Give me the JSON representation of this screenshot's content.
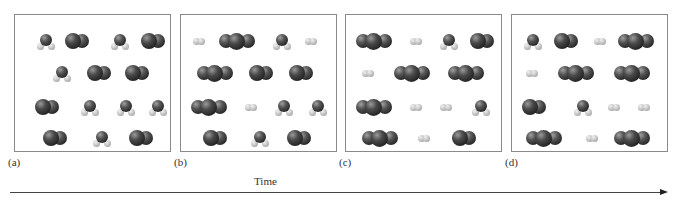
{
  "figure": {
    "axis_label": "Time",
    "legend": {
      "H2O": "bent triatomic: dark O with two light H",
      "CO": "diatomic: two dark atoms",
      "CO2": "linear triatomic: three dark atoms",
      "H2": "diatomic: two light atoms"
    },
    "panels": [
      {
        "label": "(a)",
        "left": 14,
        "rows": [
          [
            {
              "type": "H2O",
              "x": 22
            },
            {
              "type": "CO",
              "x": 50
            },
            {
              "type": "H2O",
              "x": 96
            },
            {
              "type": "CO",
              "x": 126
            }
          ],
          [
            {
              "type": "H2O",
              "x": 38
            },
            {
              "type": "CO",
              "x": 72
            },
            {
              "type": "CO",
              "x": 110
            }
          ],
          [
            {
              "type": "CO",
              "x": 20
            },
            {
              "type": "H2O",
              "x": 66
            },
            {
              "type": "H2O",
              "x": 102
            },
            {
              "type": "H2O",
              "x": 134
            }
          ],
          [
            {
              "type": "CO",
              "x": 28
            },
            {
              "type": "H2O",
              "x": 78
            },
            {
              "type": "CO",
              "x": 114
            }
          ]
        ],
        "counts": {
          "H2O": 7,
          "CO": 7,
          "CO2": 0,
          "H2": 0
        }
      },
      {
        "label": "(b)",
        "left": 180,
        "rows": [
          [
            {
              "type": "H2",
              "x": 12
            },
            {
              "type": "CO2",
              "x": 38
            },
            {
              "type": "H2O",
              "x": 92
            },
            {
              "type": "H2",
              "x": 124
            }
          ],
          [
            {
              "type": "CO2",
              "x": 16
            },
            {
              "type": "CO",
              "x": 68
            },
            {
              "type": "CO",
              "x": 108
            }
          ],
          [
            {
              "type": "CO2",
              "x": 10
            },
            {
              "type": "H2",
              "x": 64
            },
            {
              "type": "H2O",
              "x": 94
            },
            {
              "type": "H2O",
              "x": 128
            }
          ],
          [
            {
              "type": "CO",
              "x": 22
            },
            {
              "type": "H2O",
              "x": 70
            },
            {
              "type": "CO",
              "x": 106
            }
          ]
        ],
        "counts": {
          "H2O": 4,
          "CO": 4,
          "CO2": 3,
          "H2": 3
        }
      },
      {
        "label": "(c)",
        "left": 345,
        "rows": [
          [
            {
              "type": "CO2",
              "x": 10
            },
            {
              "type": "H2",
              "x": 64
            },
            {
              "type": "H2O",
              "x": 94
            },
            {
              "type": "CO",
              "x": 124
            }
          ],
          [
            {
              "type": "H2",
              "x": 16
            },
            {
              "type": "CO2",
              "x": 48
            },
            {
              "type": "CO2",
              "x": 102
            }
          ],
          [
            {
              "type": "CO2",
              "x": 10
            },
            {
              "type": "H2",
              "x": 64
            },
            {
              "type": "H2",
              "x": 94
            },
            {
              "type": "H2O",
              "x": 126
            }
          ],
          [
            {
              "type": "CO2",
              "x": 16
            },
            {
              "type": "H2",
              "x": 72
            },
            {
              "type": "CO",
              "x": 106
            }
          ]
        ],
        "counts": {
          "H2O": 2,
          "CO": 2,
          "CO2": 5,
          "H2": 5
        }
      },
      {
        "label": "(d)",
        "left": 511,
        "rows": [
          [
            {
              "type": "H2O",
              "x": 12
            },
            {
              "type": "CO",
              "x": 42
            },
            {
              "type": "H2",
              "x": 82
            },
            {
              "type": "CO2",
              "x": 106
            }
          ],
          [
            {
              "type": "H2",
              "x": 14
            },
            {
              "type": "CO2",
              "x": 46
            },
            {
              "type": "CO2",
              "x": 102
            }
          ],
          [
            {
              "type": "CO",
              "x": 10
            },
            {
              "type": "H2O",
              "x": 62
            },
            {
              "type": "H2",
              "x": 96
            },
            {
              "type": "H2",
              "x": 126
            }
          ],
          [
            {
              "type": "CO2",
              "x": 14
            },
            {
              "type": "H2",
              "x": 74
            },
            {
              "type": "CO2",
              "x": 102
            }
          ]
        ],
        "counts": {
          "H2O": 2,
          "CO": 2,
          "CO2": 5,
          "H2": 5
        }
      }
    ],
    "row_y": [
      20,
      52,
      86,
      117
    ]
  }
}
